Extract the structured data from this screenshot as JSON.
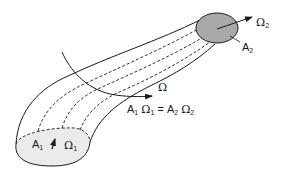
{
  "diagram": {
    "type": "flux-tube",
    "labels": {
      "omega2_symbol": "Ω",
      "omega2_sub": "2",
      "a2_symbol": "A",
      "a2_sub": "2",
      "omega_symbol": "Ω",
      "a1_symbol": "A",
      "a1_sub": "1",
      "omega1_symbol": "Ω",
      "omega1_sub": "1",
      "eq_a1": "A",
      "eq_a1_sub": "1",
      "eq_om1": "Ω",
      "eq_om1_sub": "1",
      "eq_equals": "=",
      "eq_a2": "A",
      "eq_a2_sub": "2",
      "eq_om2": "Ω",
      "eq_om2_sub": "2"
    },
    "colors": {
      "stroke": "#1a1a1a",
      "end_cap_fill": "#a9a9a9",
      "start_cap_fill": "#ebebeb",
      "background": "#ffffff"
    }
  }
}
